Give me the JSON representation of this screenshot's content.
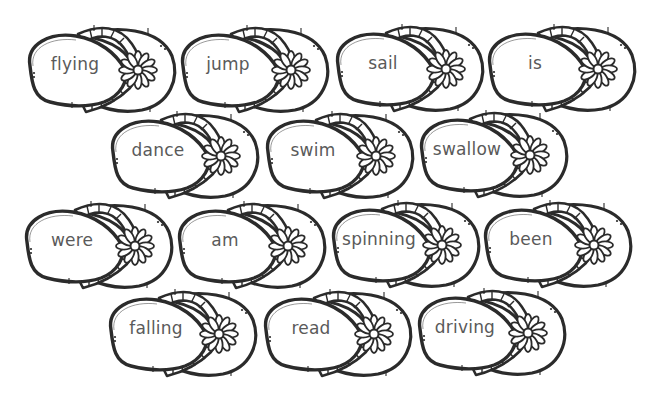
{
  "worksheet": {
    "theme": "flip-flop word cards",
    "colors": {
      "outline": "#2b2b2b",
      "word_text": "#5a5a5a",
      "background": "#ffffff"
    },
    "rows": [
      {
        "words": [
          "flying",
          "jump",
          "sail",
          "is"
        ]
      },
      {
        "words": [
          "dance",
          "swim",
          "swallow"
        ]
      },
      {
        "words": [
          "were",
          "am",
          "spinning",
          "been"
        ]
      },
      {
        "words": [
          "falling",
          "read",
          "driving"
        ]
      }
    ],
    "cards": [
      {
        "word": "flying",
        "icon": "daisy-icon"
      },
      {
        "word": "jump",
        "icon": "daisy-icon"
      },
      {
        "word": "sail",
        "icon": "daisy-icon"
      },
      {
        "word": "is",
        "icon": "daisy-icon"
      },
      {
        "word": "dance",
        "icon": "daisy-icon"
      },
      {
        "word": "swim",
        "icon": "daisy-icon"
      },
      {
        "word": "swallow",
        "icon": "daisy-icon"
      },
      {
        "word": "were",
        "icon": "daisy-icon"
      },
      {
        "word": "am",
        "icon": "daisy-icon"
      },
      {
        "word": "spinning",
        "icon": "daisy-icon"
      },
      {
        "word": "been",
        "icon": "daisy-icon"
      },
      {
        "word": "falling",
        "icon": "daisy-icon"
      },
      {
        "word": "read",
        "icon": "daisy-icon"
      },
      {
        "word": "driving",
        "icon": "daisy-icon"
      }
    ]
  }
}
